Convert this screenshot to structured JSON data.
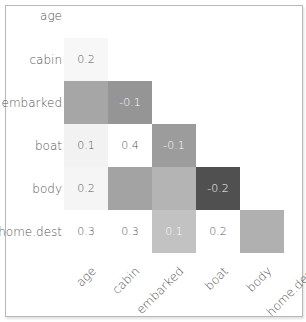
{
  "chart_data": {
    "type": "heatmap",
    "title": "",
    "variables": [
      "age",
      "cabin",
      "embarked",
      "boat",
      "body",
      "home.dest"
    ],
    "row_labels": [
      "age",
      "cabin",
      "embarked",
      "boat",
      "body",
      "home.dest"
    ],
    "col_labels": [
      "age",
      "cabin",
      "embarked",
      "boat",
      "body",
      "home.dest"
    ],
    "matrix_shape": "lower-triangular (nullity correlation)",
    "cells": [
      {
        "row": "cabin",
        "col": "age",
        "value": 0.2,
        "label": "0.2",
        "color": "#f7f7f7",
        "text_color": "#555555"
      },
      {
        "row": "embarked",
        "col": "age",
        "value": null,
        "label": "",
        "color": "#a6a6a6",
        "text_color": "#ffffff"
      },
      {
        "row": "embarked",
        "col": "cabin",
        "value": -0.1,
        "label": "-0.1",
        "color": "#959595",
        "text_color": "#ffffff"
      },
      {
        "row": "boat",
        "col": "age",
        "value": 0.1,
        "label": "0.1",
        "color": "#f2f2f2",
        "text_color": "#555555"
      },
      {
        "row": "boat",
        "col": "cabin",
        "value": 0.4,
        "label": "0.4",
        "color": "#ffffff",
        "text_color": "#555555"
      },
      {
        "row": "boat",
        "col": "embarked",
        "value": -0.1,
        "label": "-0.1",
        "color": "#9c9c9c",
        "text_color": "#ffffff"
      },
      {
        "row": "body",
        "col": "age",
        "value": 0.2,
        "label": "0.2",
        "color": "#f5f5f5",
        "text_color": "#555555"
      },
      {
        "row": "body",
        "col": "cabin",
        "value": null,
        "label": "",
        "color": "#a3a3a3",
        "text_color": "#ffffff"
      },
      {
        "row": "body",
        "col": "embarked",
        "value": null,
        "label": "",
        "color": "#b4b4b4",
        "text_color": "#ffffff"
      },
      {
        "row": "body",
        "col": "boat",
        "value": -0.2,
        "label": "-0.2",
        "color": "#505050",
        "text_color": "#ffffff"
      },
      {
        "row": "home.dest",
        "col": "age",
        "value": 0.3,
        "label": "0.3",
        "color": "#ffffff",
        "text_color": "#555555"
      },
      {
        "row": "home.dest",
        "col": "cabin",
        "value": 0.3,
        "label": "0.3",
        "color": "#ffffff",
        "text_color": "#555555"
      },
      {
        "row": "home.dest",
        "col": "embarked",
        "value": 0.1,
        "label": "0.1",
        "color": "#c2c2c2",
        "text_color": "#ffffff"
      },
      {
        "row": "home.dest",
        "col": "boat",
        "value": 0.2,
        "label": "0.2",
        "color": "#ffffff",
        "text_color": "#555555"
      },
      {
        "row": "home.dest",
        "col": "body",
        "value": null,
        "label": "",
        "color": "#b0b0b0",
        "text_color": "#ffffff"
      }
    ],
    "colormap": "grayscale (dark = negative, light = positive)",
    "grid": false,
    "legend": "none"
  }
}
